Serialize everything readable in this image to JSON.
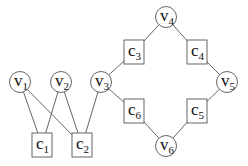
{
  "diagram": {
    "type": "bipartite-factor-graph",
    "variables": [
      {
        "id": "v1",
        "base": "v",
        "sub": "1",
        "x": 20,
        "y": 82
      },
      {
        "id": "v2",
        "base": "v",
        "sub": "2",
        "x": 61,
        "y": 82
      },
      {
        "id": "v3",
        "base": "v",
        "sub": "3",
        "x": 101,
        "y": 82
      },
      {
        "id": "v4",
        "base": "v",
        "sub": "4",
        "x": 166,
        "y": 17
      },
      {
        "id": "v5",
        "base": "v",
        "sub": "5",
        "x": 227,
        "y": 82
      },
      {
        "id": "v6",
        "base": "v",
        "sub": "6",
        "x": 166,
        "y": 146
      }
    ],
    "checks": [
      {
        "id": "c1",
        "base": "c",
        "sub": "1",
        "x": 42,
        "y": 145
      },
      {
        "id": "c2",
        "base": "c",
        "sub": "2",
        "x": 82,
        "y": 145
      },
      {
        "id": "c3",
        "base": "c",
        "sub": "3",
        "x": 134,
        "y": 52
      },
      {
        "id": "c4",
        "base": "c",
        "sub": "4",
        "x": 197,
        "y": 52
      },
      {
        "id": "c5",
        "base": "c",
        "sub": "5",
        "x": 197,
        "y": 111
      },
      {
        "id": "c6",
        "base": "c",
        "sub": "6",
        "x": 134,
        "y": 111
      }
    ],
    "edges": [
      [
        "v1",
        "c1"
      ],
      [
        "v1",
        "c2"
      ],
      [
        "v2",
        "c1"
      ],
      [
        "v2",
        "c2"
      ],
      [
        "v3",
        "c2"
      ],
      [
        "v3",
        "c3"
      ],
      [
        "v3",
        "c6"
      ],
      [
        "v4",
        "c3"
      ],
      [
        "v4",
        "c4"
      ],
      [
        "v5",
        "c4"
      ],
      [
        "v5",
        "c5"
      ],
      [
        "v6",
        "c5"
      ],
      [
        "v6",
        "c6"
      ]
    ]
  }
}
